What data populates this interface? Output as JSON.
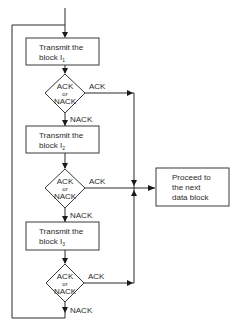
{
  "diagram": {
    "type": "flowchart",
    "title": "",
    "steps": [
      {
        "id": "tx1",
        "label_line1": "Transmit the",
        "label_line2": "block I",
        "subscript": "1"
      },
      {
        "id": "dec1",
        "top": "ACK",
        "mid": "or",
        "bottom": "NACK",
        "ack_label": "ACK",
        "nack_label": "NACK"
      },
      {
        "id": "tx2",
        "label_line1": "Transmit the",
        "label_line2": "block I",
        "subscript": "2"
      },
      {
        "id": "dec2",
        "top": "ACK",
        "mid": "or",
        "bottom": "NACK",
        "ack_label": "ACK",
        "nack_label": "NACK"
      },
      {
        "id": "tx3",
        "label_line1": "Transmit the",
        "label_line2": "block I",
        "subscript": "3"
      },
      {
        "id": "dec3",
        "top": "ACK",
        "mid": "or",
        "bottom": "NACK",
        "ack_label": "ACK",
        "nack_label": "NACK"
      }
    ],
    "next": {
      "line1": "Proceed to",
      "line2": "the next",
      "line3": "data block"
    }
  }
}
